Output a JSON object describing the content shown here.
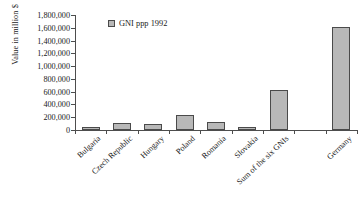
{
  "chart_data": {
    "type": "bar",
    "title": "",
    "xlabel": "",
    "ylabel": "Value in million $",
    "categories": [
      "Bulgaria",
      "Czech Republic",
      "Hungary",
      "Poland",
      "Romania",
      "Slovakia",
      "Sum of the six GNIs",
      "Germany"
    ],
    "values": [
      40000,
      110000,
      95000,
      230000,
      120000,
      45000,
      620000,
      1620000
    ],
    "series": [
      {
        "name": "GNI ppp 1992",
        "values": [
          40000,
          110000,
          95000,
          230000,
          120000,
          45000,
          620000,
          1620000
        ]
      }
    ],
    "ylim": [
      0,
      1800000
    ],
    "ytick_step": 200000,
    "ytick_labels": [
      "0",
      "200,000",
      "400,000",
      "600,000",
      "800,000",
      "1,000,000",
      "1,200,000",
      "1,400,000",
      "1,600,000",
      "1,800,000"
    ],
    "grid": false,
    "legend": {
      "position": "top-left-inside",
      "entries": [
        "GNI ppp 1992"
      ]
    },
    "bar_color": "#b8b8b8",
    "bar_border_color": "#4a4a4a",
    "axis_color": "#4d4d4d",
    "gap_before_last_category": true
  }
}
